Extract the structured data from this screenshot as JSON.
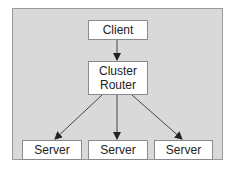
{
  "diagram": {
    "nodes": {
      "client": "Client",
      "router_line1": "Cluster",
      "router_line2": "Router",
      "server1": "Server",
      "server2": "Server",
      "server3": "Server"
    },
    "edges": [
      {
        "from": "Client",
        "to": "Cluster Router"
      },
      {
        "from": "Cluster Router",
        "to": "Server (left)"
      },
      {
        "from": "Cluster Router",
        "to": "Server (middle)"
      },
      {
        "from": "Cluster Router",
        "to": "Server (right)"
      }
    ],
    "colors": {
      "background": "#d9d9d9",
      "node_fill": "#ffffff",
      "stroke": "#333333"
    }
  }
}
